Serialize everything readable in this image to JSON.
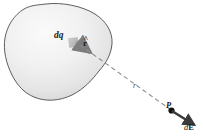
{
  "figure": {
    "kind": "physics-diagram",
    "background_color": "#ffffff",
    "width": 203,
    "height": 137
  },
  "labels": {
    "charge_element": "dq",
    "unit_vector_base": "r",
    "unit_vector_hat": "^",
    "distance": "r",
    "field_point": "P",
    "field_vector_d": "d",
    "field_vector_E": "E"
  },
  "colors": {
    "blob_outline": "#4d4d4d",
    "blob_fill_light": "#f4f4f4",
    "blob_fill_dark": "#d9d9d9",
    "charge_square": "#b9b9b9",
    "unit_vector_arrow": "#8c8c8c",
    "dashed_line": "#8a8a8a",
    "field_arrow": "#3a3a3a",
    "point_dot": "#111111",
    "text": "#1a1a1a"
  },
  "geometry": {
    "charge_square": {
      "x": 69,
      "y": 38,
      "size": 9
    },
    "unit_vector": {
      "x1": 75,
      "y1": 41,
      "x2": 92,
      "y2": 53
    },
    "dashed_line": {
      "x1": 80,
      "y1": 45,
      "x2": 172,
      "y2": 111
    },
    "field_arrow": {
      "x1": 172,
      "y1": 111,
      "x2": 196,
      "y2": 126
    },
    "point_P": {
      "x": 171,
      "y": 110,
      "r": 3
    }
  }
}
